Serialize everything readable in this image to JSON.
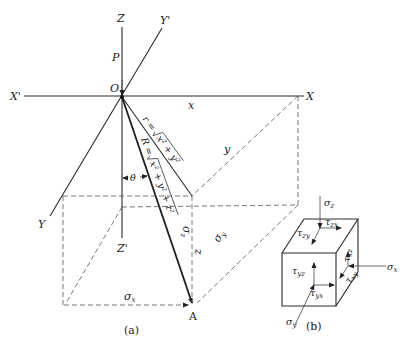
{
  "figure_a": {
    "caption": "(a)",
    "axes": {
      "z_pos": "Z",
      "z_neg": "Z'",
      "x_pos": "X",
      "x_neg": "X'",
      "y_pos": "Y'",
      "y_neg": "Y"
    },
    "origin_label": "O",
    "load_label": "P",
    "x_dim_label": "x",
    "y_dim_label": "y",
    "z_dim_label": "z",
    "angle_label": "θ",
    "r_formula": {
      "lhs": "r = ",
      "radicand": "x² + y²"
    },
    "R_formula": {
      "lhs": "R = ",
      "radicand": "x² + y² + z²"
    },
    "stress_labels": {
      "sigma_x": "σ",
      "sigma_x_sub": "x",
      "sigma_y": "σ",
      "sigma_y_sub": "y",
      "sigma_z": "σ",
      "sigma_z_sub": "z"
    },
    "point_label": "A"
  },
  "figure_b": {
    "caption": "(b)",
    "labels": {
      "sigma_z": "σ",
      "sigma_z_sub": "z",
      "sigma_x": "σ",
      "sigma_x_sub": "x",
      "sigma_y": "σ",
      "sigma_y_sub": "y",
      "tau_zx": "τ",
      "tau_zx_sub": "zx",
      "tau_zy": "τ",
      "tau_zy_sub": "zy",
      "tau_xz": "τ",
      "tau_xz_sub": "xz",
      "tau_xy": "τ",
      "tau_xy_sub": "xy",
      "tau_yz": "τ",
      "tau_yz_sub": "yz",
      "tau_yx": "τ",
      "tau_yx_sub": "yx"
    }
  },
  "colors": {
    "line": "#2a2a2a",
    "background": "#ffffff"
  }
}
